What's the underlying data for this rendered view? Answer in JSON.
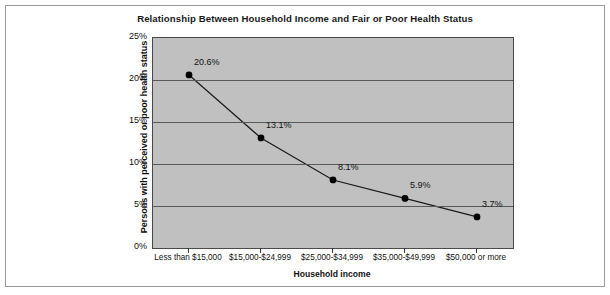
{
  "frame": {
    "border_color": "#9a9a9a",
    "background": "#ffffff"
  },
  "chart_data": {
    "type": "line",
    "title": "Relationship Between Household Income and Fair or Poor Health Status",
    "xlabel": "Household income",
    "ylabel": "Persons with perceived or poor health status",
    "categories": [
      "Less than $15,000",
      "$15,000-$24,999",
      "$25,000-$34,999",
      "$35,000-$49,999",
      "$50,000 or more"
    ],
    "values": [
      20.6,
      13.1,
      8.1,
      5.9,
      3.7
    ],
    "data_labels": [
      "20.6%",
      "13.1%",
      "8.1%",
      "5.9%",
      "3.7%"
    ],
    "ylim": [
      0,
      25
    ],
    "ytick_labels": [
      "25%",
      "20%",
      "15%",
      "10%",
      "5%",
      "0%"
    ],
    "ytick_values": [
      25,
      20,
      15,
      10,
      5,
      0
    ],
    "grid": true,
    "legend": "none",
    "plot_background": "#c0c0c0",
    "line_color": "#1a1a1a",
    "marker_color": "#000000",
    "marker_shape": "circle",
    "gridline_color": "#595959"
  }
}
